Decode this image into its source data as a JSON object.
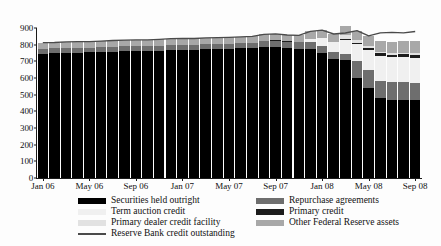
{
  "chart_data": {
    "type": "bar",
    "stacked": true,
    "title": "",
    "subtitle": "",
    "xlabel": "",
    "ylabel": "",
    "ylim": [
      0,
      900
    ],
    "ytick_values": [
      0,
      100,
      200,
      300,
      400,
      500,
      600,
      700,
      800,
      900
    ],
    "ytick_labels": [
      "0",
      "100",
      "200",
      "300",
      "400",
      "500",
      "600",
      "700",
      "800",
      "900"
    ],
    "grid": false,
    "legend_position": "below",
    "x": [
      "Jan 06",
      "Feb 06",
      "Mar 06",
      "Apr 06",
      "May 06",
      "Jun 06",
      "Jul 06",
      "Aug 06",
      "Sep 06",
      "Oct 06",
      "Nov 06",
      "Dec 06",
      "Jan 07",
      "Feb 07",
      "Mar 07",
      "Apr 07",
      "May 07",
      "Jun 07",
      "Jul 07",
      "Aug 07",
      "Sep 07",
      "Oct 07",
      "Nov 07",
      "Dec 07",
      "Jan 08",
      "Feb 08",
      "Mar 08",
      "Apr 08",
      "May 08",
      "Jun 08",
      "Jul 08",
      "Aug 08",
      "Sep 08"
    ],
    "xtick_labels": [
      "Jan 06",
      "May 06",
      "Sep 06",
      "Jan 07",
      "May 07",
      "Sep 07",
      "Jan 08",
      "May 08",
      "Sep 08"
    ],
    "xtick_indices": [
      0,
      4,
      8,
      12,
      16,
      20,
      24,
      28,
      32
    ],
    "series": [
      {
        "name": "Securities held outright",
        "key": "sec",
        "color": "#000000",
        "values": [
          742,
          748,
          752,
          752,
          755,
          757,
          759,
          760,
          761,
          762,
          765,
          767,
          768,
          769,
          772,
          773,
          775,
          778,
          781,
          786,
          784,
          778,
          772,
          772,
          748,
          715,
          710,
          602,
          541,
          480,
          467,
          467,
          467
        ]
      },
      {
        "name": "Repurchase agreements",
        "key": "rp",
        "color": "#6e6e6e",
        "values": [
          34,
          30,
          29,
          31,
          27,
          28,
          30,
          31,
          31,
          30,
          30,
          31,
          31,
          30,
          31,
          31,
          31,
          31,
          31,
          36,
          40,
          41,
          43,
          44,
          43,
          40,
          37,
          100,
          105,
          105,
          108,
          108,
          105
        ]
      },
      {
        "name": "Term auction credit",
        "key": "tac",
        "color": "#f0f0f0",
        "values": [
          0,
          0,
          0,
          0,
          0,
          0,
          0,
          0,
          0,
          0,
          0,
          0,
          0,
          0,
          0,
          0,
          0,
          0,
          0,
          0,
          0,
          0,
          0,
          20,
          50,
          60,
          80,
          100,
          125,
          150,
          150,
          150,
          150
        ]
      },
      {
        "name": "Primary credit",
        "key": "pc",
        "color": "#1c1c1c",
        "values": [
          0,
          0,
          0,
          0,
          0,
          0,
          0,
          0,
          0,
          0,
          0,
          0,
          0,
          0,
          0,
          0,
          0,
          0,
          0,
          2,
          3,
          1,
          1,
          1,
          1,
          1,
          6,
          10,
          12,
          14,
          15,
          18,
          19
        ]
      },
      {
        "name": "Primary dealer credit facility",
        "key": "pdcf",
        "color": "#e2e2e2",
        "values": [
          0,
          0,
          0,
          0,
          0,
          0,
          0,
          0,
          0,
          0,
          0,
          0,
          0,
          0,
          0,
          0,
          0,
          0,
          0,
          0,
          0,
          0,
          0,
          0,
          0,
          0,
          25,
          18,
          12,
          10,
          8,
          8,
          8
        ]
      },
      {
        "name": "Other Federal Reserve assets",
        "key": "ofra",
        "color": "#a8a8a8",
        "values": [
          36,
          35,
          36,
          35,
          36,
          36,
          36,
          36,
          37,
          37,
          37,
          38,
          38,
          38,
          38,
          38,
          38,
          38,
          38,
          38,
          38,
          38,
          40,
          43,
          45,
          48,
          52,
          54,
          58,
          62,
          66,
          70,
          75
        ]
      }
    ],
    "line_series": {
      "name": "Reserve Bank credit outstanding",
      "color": "#4a4a4a",
      "values": [
        812,
        813,
        817,
        818,
        818,
        821,
        825,
        827,
        829,
        829,
        832,
        836,
        837,
        837,
        841,
        842,
        844,
        847,
        850,
        862,
        865,
        858,
        856,
        880,
        887,
        864,
        870,
        884,
        853,
        871,
        874,
        871,
        879
      ]
    }
  },
  "legend": {
    "left_column": [
      {
        "label": "Securities held outright",
        "swatch": "sw-sec",
        "kind": "box"
      },
      {
        "label": "Term auction credit",
        "swatch": "sw-tac",
        "kind": "box"
      },
      {
        "label": "Primary dealer credit facility",
        "swatch": "sw-pdcf",
        "kind": "box"
      },
      {
        "label": "Reserve Bank credit outstanding",
        "swatch": "sw-rbc",
        "kind": "line"
      }
    ],
    "right_column": [
      {
        "label": "Repurchase agreements",
        "swatch": "sw-rp",
        "kind": "box"
      },
      {
        "label": "Primary credit",
        "swatch": "sw-pc",
        "kind": "box"
      },
      {
        "label": "Other Federal Reserve assets",
        "swatch": "sw-ofra",
        "kind": "box"
      }
    ]
  },
  "colors": {
    "securities_held_outright": "#000000",
    "repurchase_agreements": "#6e6e6e",
    "term_auction_credit": "#f0f0f0",
    "primary_credit": "#1c1c1c",
    "primary_dealer_credit_facility": "#e2e2e2",
    "other_federal_reserve_assets": "#a8a8a8",
    "reserve_bank_credit_outstanding": "#4a4a4a",
    "axis": "#1a1a1a",
    "background": "#fdfdfd"
  }
}
